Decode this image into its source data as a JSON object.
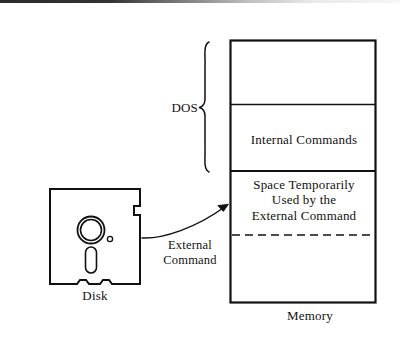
{
  "figure": {
    "ink_color": "#111111",
    "background_color": "#ffffff"
  },
  "memory": {
    "caption": "Memory",
    "bracket_label": "DOS",
    "cells": [
      {
        "id": "dos-kernel",
        "label": ""
      },
      {
        "id": "internal-commands",
        "label": "Internal Commands"
      },
      {
        "id": "transient-space",
        "label": "Space Temporarily\nUsed by the\nExternal Command"
      },
      {
        "id": "free-memory",
        "label": ""
      }
    ]
  },
  "disk": {
    "caption": "Disk"
  },
  "arrow": {
    "label": "External\nCommand"
  }
}
